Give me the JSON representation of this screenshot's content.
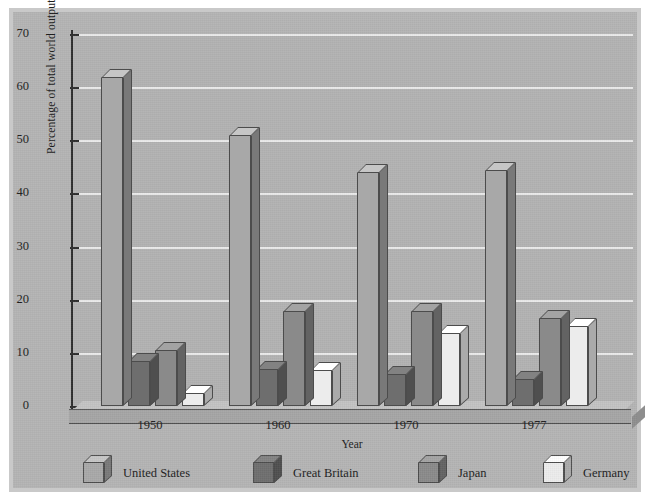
{
  "chart_data": {
    "type": "bar",
    "title": "",
    "xlabel": "Year",
    "ylabel": "Percentage of total world output",
    "categories": [
      "1950",
      "1960",
      "1970",
      "1977"
    ],
    "ylim": [
      0,
      70
    ],
    "yticks": [
      0,
      10,
      20,
      30,
      40,
      50,
      60,
      70
    ],
    "ytick_labels": [
      "0",
      "10",
      "20",
      "30",
      "40",
      "50",
      "60",
      "70"
    ],
    "grid": true,
    "legend_position": "bottom",
    "style": "3d-isometric-bars",
    "series": [
      {
        "name": "United States",
        "color": "#a8a8a8",
        "values": [
          62,
          51,
          44,
          44.5
        ]
      },
      {
        "name": "Great Britain",
        "color": "#6e6e6e",
        "values": [
          8.5,
          7,
          6,
          5
        ]
      },
      {
        "name": "Japan",
        "color": "#8a8a8a",
        "values": [
          10.5,
          17.8,
          17.8,
          16.5
        ]
      },
      {
        "name": "Germany",
        "color": "#ececec",
        "values": [
          2.5,
          6.8,
          13.8,
          15
        ]
      }
    ]
  },
  "colors": {
    "page_background": "#ffffff",
    "frame": "#c9c9c9",
    "panel": "#b4b4b4",
    "plot_background": "#b2b2b2",
    "gridline": "#efefef",
    "axis": "#2e2e2e",
    "text": "#1c1c1c"
  }
}
